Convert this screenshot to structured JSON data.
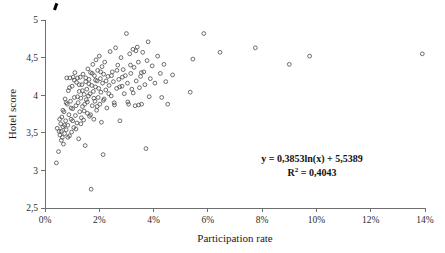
{
  "chart_data": {
    "type": "scatter",
    "title": "",
    "xlabel": "Participation rate",
    "ylabel": "Hotel score",
    "xlim": [
      0,
      14
    ],
    "ylim": [
      2.5,
      5
    ],
    "grid": false,
    "legend": "none",
    "x_tick_labels": [
      "0%",
      "2%",
      "4%",
      "6%",
      "8%",
      "10%",
      "12%",
      "14%"
    ],
    "x_tick_values": [
      0,
      2,
      4,
      6,
      8,
      10,
      12,
      14
    ],
    "y_tick_labels": [
      "2,5",
      "3",
      "3,5",
      "4",
      "4,5",
      "5"
    ],
    "y_tick_values": [
      2.5,
      3,
      3.5,
      4,
      4.5,
      5
    ],
    "annotations": {
      "equation": "y = 0,3853ln(x) + 5,5389",
      "r_squared_prefix": "R",
      "r_squared_exponent": "2",
      "r_squared_value": " = 0,4043"
    },
    "trendline": {
      "type": "logarithmic",
      "equation": "y = 0,3853ln(x) + 5,5389",
      "slope": 0.3853,
      "intercept": 5.5389,
      "r_squared": 0.4043,
      "x_start": 0.35,
      "x_end": 14.0,
      "style": "dashed",
      "color": "#000000"
    },
    "marker": {
      "shape": "open-circle",
      "radius": 1.9,
      "color": "#4a4a4a",
      "fill": "none"
    },
    "series": [
      {
        "name": "Hotels",
        "points": [
          [
            0.42,
            3.1
          ],
          [
            0.45,
            3.56
          ],
          [
            0.52,
            3.52
          ],
          [
            0.55,
            3.47
          ],
          [
            0.58,
            3.62
          ],
          [
            0.6,
            3.4
          ],
          [
            0.62,
            3.71
          ],
          [
            0.64,
            3.44
          ],
          [
            0.66,
            3.58
          ],
          [
            0.68,
            3.35
          ],
          [
            0.7,
            3.78
          ],
          [
            0.72,
            3.49
          ],
          [
            0.74,
            3.95
          ],
          [
            0.76,
            3.66
          ],
          [
            0.78,
            3.54
          ],
          [
            0.8,
            4.23
          ],
          [
            0.82,
            3.88
          ],
          [
            0.84,
            3.6
          ],
          [
            0.86,
            4.06
          ],
          [
            0.88,
            3.74
          ],
          [
            0.9,
            3.46
          ],
          [
            0.92,
            4.23
          ],
          [
            0.94,
            3.92
          ],
          [
            0.96,
            3.68
          ],
          [
            0.98,
            3.51
          ],
          [
            1.0,
            4.12
          ],
          [
            1.02,
            3.82
          ],
          [
            1.04,
            4.24
          ],
          [
            1.06,
            3.57
          ],
          [
            1.08,
            3.97
          ],
          [
            1.1,
            4.3
          ],
          [
            1.12,
            3.73
          ],
          [
            1.14,
            3.86
          ],
          [
            1.16,
            4.17
          ],
          [
            1.18,
            3.63
          ],
          [
            1.2,
            4.23
          ],
          [
            1.22,
            3.9
          ],
          [
            1.24,
            3.42
          ],
          [
            1.26,
            4.05
          ],
          [
            1.28,
            3.78
          ],
          [
            1.3,
            4.24
          ],
          [
            1.32,
            3.96
          ],
          [
            1.34,
            3.7
          ],
          [
            1.36,
            4.14
          ],
          [
            1.38,
            3.85
          ],
          [
            1.4,
            4.28
          ],
          [
            1.42,
            3.67
          ],
          [
            1.44,
            4.01
          ],
          [
            1.46,
            3.88
          ],
          [
            1.48,
            3.33
          ],
          [
            1.5,
            4.18
          ],
          [
            1.52,
            3.94
          ],
          [
            1.54,
            4.08
          ],
          [
            1.56,
            3.76
          ],
          [
            1.58,
            4.35
          ],
          [
            1.6,
            3.99
          ],
          [
            1.62,
            4.21
          ],
          [
            1.64,
            3.72
          ],
          [
            1.66,
            4.02
          ],
          [
            1.68,
            4.3
          ],
          [
            1.7,
            2.75
          ],
          [
            1.72,
            4.13
          ],
          [
            1.74,
            3.86
          ],
          [
            1.76,
            4.41
          ],
          [
            1.78,
            4.05
          ],
          [
            1.8,
            3.68
          ],
          [
            1.82,
            4.26
          ],
          [
            1.84,
            3.92
          ],
          [
            1.86,
            4.11
          ],
          [
            1.88,
            4.47
          ],
          [
            1.9,
            3.8
          ],
          [
            1.92,
            4.19
          ],
          [
            1.94,
            4.33
          ],
          [
            1.96,
            3.97
          ],
          [
            1.98,
            4.09
          ],
          [
            2.0,
            4.52
          ],
          [
            2.02,
            3.88
          ],
          [
            2.04,
            4.22
          ],
          [
            2.06,
            4.04
          ],
          [
            2.08,
            3.64
          ],
          [
            2.1,
            4.38
          ],
          [
            2.12,
            4.16
          ],
          [
            2.14,
            3.21
          ],
          [
            2.16,
            4.28
          ],
          [
            2.18,
            3.95
          ],
          [
            2.2,
            4.44
          ],
          [
            2.24,
            4.07
          ],
          [
            2.28,
            3.83
          ],
          [
            2.32,
            4.25
          ],
          [
            2.36,
            4.13
          ],
          [
            2.4,
            4.58
          ],
          [
            2.44,
            3.99
          ],
          [
            2.48,
            4.31
          ],
          [
            2.52,
            4.18
          ],
          [
            2.56,
            3.87
          ],
          [
            2.6,
            4.63
          ],
          [
            2.64,
            4.09
          ],
          [
            2.68,
            4.4
          ],
          [
            2.72,
            4.21
          ],
          [
            2.76,
            3.66
          ],
          [
            2.8,
            4.5
          ],
          [
            2.84,
            4.12
          ],
          [
            2.88,
            4.34
          ],
          [
            2.92,
            4.02
          ],
          [
            2.96,
            4.26
          ],
          [
            3.0,
            4.82
          ],
          [
            3.04,
            4.16
          ],
          [
            3.08,
            3.88
          ],
          [
            3.12,
            4.55
          ],
          [
            3.16,
            4.29
          ],
          [
            3.2,
            4.08
          ],
          [
            3.24,
            4.61
          ],
          [
            3.28,
            4.37
          ],
          [
            3.32,
            3.86
          ],
          [
            3.36,
            4.19
          ],
          [
            3.4,
            4.64
          ],
          [
            3.44,
            4.44
          ],
          [
            3.48,
            4.1
          ],
          [
            3.52,
            4.25
          ],
          [
            3.56,
            3.88
          ],
          [
            3.6,
            4.57
          ],
          [
            3.64,
            4.31
          ],
          [
            3.68,
            4.14
          ],
          [
            3.72,
            3.29
          ],
          [
            3.76,
            4.46
          ],
          [
            3.8,
            4.71
          ],
          [
            3.84,
            3.98
          ],
          [
            3.88,
            4.22
          ],
          [
            3.95,
            4.39
          ],
          [
            4.05,
            4.16
          ],
          [
            4.15,
            4.52
          ],
          [
            4.25,
            4.29
          ],
          [
            4.3,
            3.97
          ],
          [
            4.38,
            4.41
          ],
          [
            4.45,
            4.18
          ],
          [
            4.52,
            3.88
          ],
          [
            4.7,
            4.27
          ],
          [
            5.35,
            4.04
          ],
          [
            5.45,
            4.48
          ],
          [
            5.85,
            4.82
          ],
          [
            6.45,
            4.57
          ],
          [
            7.75,
            4.63
          ],
          [
            9.0,
            4.41
          ],
          [
            9.75,
            4.52
          ],
          [
            13.9,
            4.55
          ],
          [
            0.5,
            3.25
          ],
          [
            0.54,
            3.68
          ],
          [
            0.6,
            3.52
          ],
          [
            0.66,
            3.8
          ],
          [
            0.72,
            3.6
          ],
          [
            0.78,
            3.9
          ],
          [
            0.84,
            3.44
          ],
          [
            0.9,
            4.1
          ],
          [
            0.96,
            3.83
          ],
          [
            1.02,
            3.66
          ],
          [
            1.08,
            4.2
          ],
          [
            1.14,
            3.55
          ],
          [
            1.2,
            3.98
          ],
          [
            1.26,
            4.14
          ],
          [
            1.32,
            3.62
          ],
          [
            1.38,
            4.06
          ],
          [
            1.44,
            3.79
          ],
          [
            1.5,
            4.23
          ],
          [
            1.56,
            3.91
          ],
          [
            1.62,
            4.15
          ],
          [
            1.68,
            3.74
          ],
          [
            1.74,
            4.29
          ],
          [
            1.8,
            3.96
          ],
          [
            1.86,
            4.2
          ],
          [
            1.92,
            3.85
          ],
          [
            2.05,
            4.31
          ],
          [
            2.15,
            3.93
          ],
          [
            2.25,
            4.19
          ],
          [
            2.35,
            4.02
          ],
          [
            2.45,
            4.26
          ],
          [
            2.55,
            3.9
          ],
          [
            2.65,
            4.33
          ],
          [
            2.75,
            4.11
          ],
          [
            2.85,
            4.24
          ],
          [
            3.05,
            3.91
          ],
          [
            3.15,
            4.4
          ],
          [
            3.25,
            4.03
          ],
          [
            3.35,
            4.59
          ],
          [
            3.45,
            3.87
          ],
          [
            3.55,
            4.3
          ]
        ]
      }
    ]
  }
}
